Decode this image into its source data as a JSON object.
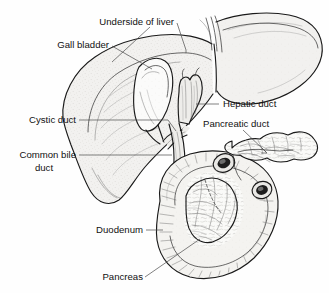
{
  "figure": {
    "background_color": "#fefefe",
    "ink_color": "#1a1a1a",
    "leader_color": "#4a4a4a",
    "style": "black-and-white line-art medical illustration with stipple and hatch shading"
  },
  "labels": {
    "underside_of_liver": "Underside of liver",
    "gall_bladder": "Gall bladder",
    "cystic_duct": "Cystic duct",
    "common_bile_duct_line1": "Common bile",
    "common_bile_duct_line2": "duct",
    "hepatic_duct": "Hepatic duct",
    "pancreatic_duct": "Pancreatic duct",
    "duodenum": "Duodenum",
    "pancreas": "Pancreas"
  },
  "structures": [
    {
      "name": "liver",
      "label": "Underside of liver",
      "side": "left",
      "note": "large two-lobed organ occupying upper half"
    },
    {
      "name": "gall-bladder",
      "label": "Gall bladder",
      "side": "left",
      "note": "pear-shaped sac on the underside of the liver"
    },
    {
      "name": "cystic-duct",
      "label": "Cystic duct",
      "side": "left",
      "note": "duct draining the gall bladder"
    },
    {
      "name": "common-bile-duct",
      "label": "Common bile duct",
      "side": "left",
      "note": "duct descending to the duodenum"
    },
    {
      "name": "hepatic-duct",
      "label": "Hepatic duct",
      "side": "right",
      "note": "Y-shaped branching duct leaving the liver"
    },
    {
      "name": "pancreatic-duct",
      "label": "Pancreatic duct",
      "side": "right",
      "note": "duct running through the pancreas"
    },
    {
      "name": "duodenum",
      "label": "Duodenum",
      "side": "left",
      "note": "C-shaped loop of small intestine"
    },
    {
      "name": "pancreas",
      "label": "Pancreas",
      "side": "left",
      "note": "lobulated gland within the duodenal loop"
    }
  ]
}
